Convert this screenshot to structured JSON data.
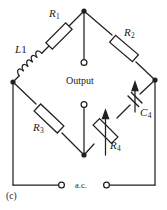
{
  "figure": {
    "panel_label": "(c)",
    "caption_note": "",
    "line_color": "#231f20",
    "background": "#ffffff"
  },
  "labels": {
    "r1": {
      "name": "R",
      "sub": "1"
    },
    "r2": {
      "name": "R",
      "sub": "2"
    },
    "r3": {
      "name": "R",
      "sub": "3"
    },
    "r4": {
      "name": "R",
      "sub": "4"
    },
    "c4": {
      "name": "C",
      "sub": "4"
    },
    "l1": {
      "name": "L",
      "sub": "1"
    },
    "output": "Output",
    "source": "a.c."
  },
  "components": [
    {
      "id": "R1",
      "type": "resistor",
      "label": "R1",
      "branch": "top-left"
    },
    {
      "id": "R2",
      "type": "resistor",
      "label": "R2",
      "branch": "top-right"
    },
    {
      "id": "R3",
      "type": "resistor",
      "label": "R3",
      "branch": "bottom-left"
    },
    {
      "id": "R4",
      "type": "variable-resistor",
      "label": "R4",
      "branch": "bottom-centre"
    },
    {
      "id": "C4",
      "type": "variable-capacitor",
      "label": "C4",
      "branch": "bottom-right"
    },
    {
      "id": "L1",
      "type": "inductor",
      "label": "L1",
      "branch": "upper-left"
    }
  ],
  "terminals": [
    {
      "id": "output-top",
      "name": "output-terminal-top"
    },
    {
      "id": "output-bottom",
      "name": "output-terminal-bottom"
    },
    {
      "id": "ac-left",
      "name": "ac-terminal-left"
    },
    {
      "id": "ac-right",
      "name": "ac-terminal-right"
    }
  ],
  "nodes": [
    {
      "id": "top",
      "x": 84,
      "y": 11
    },
    {
      "id": "left",
      "x": 13,
      "y": 82
    },
    {
      "id": "right",
      "x": 155,
      "y": 80
    },
    {
      "id": "bottom",
      "x": 84,
      "y": 155
    }
  ]
}
